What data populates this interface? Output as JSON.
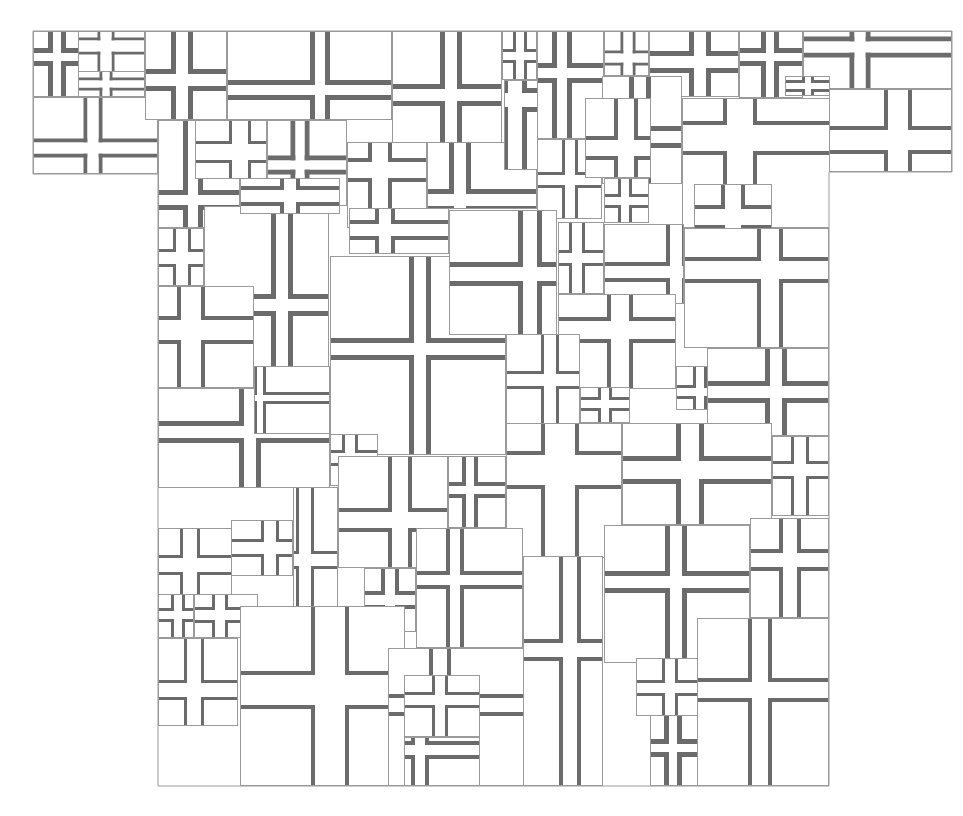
{
  "artwork": {
    "subject": "T-shirt silhouette collage of overlapping cross tiles",
    "canvas": {
      "width": 963,
      "height": 816
    },
    "colors": {
      "background": "#ffffff",
      "tile_fill": "#ffffff",
      "tile_border": "#9a9a9a",
      "cross_band": "#6b6b6b"
    },
    "silhouette": [
      [
        33,
        31
      ],
      [
        952,
        31
      ],
      [
        952,
        172
      ],
      [
        829,
        172
      ],
      [
        829,
        786
      ],
      [
        158,
        786
      ],
      [
        158,
        174
      ],
      [
        33,
        174
      ]
    ],
    "tiles": [
      {
        "x": 33,
        "y": 97,
        "w": 125,
        "h": 77,
        "cx": 93,
        "cy": 148,
        "g": 11,
        "t": 4
      },
      {
        "x": 33,
        "y": 31,
        "w": 46,
        "h": 66,
        "cx": 57,
        "cy": 57,
        "g": 8,
        "t": 5
      },
      {
        "x": 78,
        "y": 31,
        "w": 67,
        "h": 48,
        "cx": 106,
        "cy": 46,
        "g": 11,
        "t": 3
      },
      {
        "x": 78,
        "y": 71,
        "w": 67,
        "h": 26,
        "cx": 106,
        "cy": 84,
        "g": 7,
        "t": 3
      },
      {
        "x": 145,
        "y": 31,
        "w": 82,
        "h": 89,
        "cx": 182,
        "cy": 80,
        "g": 12,
        "t": 5
      },
      {
        "x": 227,
        "y": 31,
        "w": 165,
        "h": 89,
        "cx": 320,
        "cy": 90,
        "g": 10,
        "t": 5
      },
      {
        "x": 392,
        "y": 31,
        "w": 110,
        "h": 112,
        "cx": 451,
        "cy": 95,
        "g": 12,
        "t": 5
      },
      {
        "x": 502,
        "y": 31,
        "w": 35,
        "h": 49,
        "cx": 520,
        "cy": 56,
        "g": 8,
        "t": 3
      },
      {
        "x": 537,
        "y": 31,
        "w": 67,
        "h": 108,
        "cx": 562,
        "cy": 73,
        "g": 10,
        "t": 5
      },
      {
        "x": 604,
        "y": 31,
        "w": 45,
        "h": 45,
        "cx": 628,
        "cy": 58,
        "g": 9,
        "t": 3
      },
      {
        "x": 649,
        "y": 31,
        "w": 90,
        "h": 66,
        "cx": 700,
        "cy": 62,
        "g": 12,
        "t": 5
      },
      {
        "x": 739,
        "y": 31,
        "w": 64,
        "h": 67,
        "cx": 770,
        "cy": 57,
        "g": 8,
        "t": 5
      },
      {
        "x": 803,
        "y": 31,
        "w": 149,
        "h": 58,
        "cx": 860,
        "cy": 47,
        "g": 11,
        "t": 5
      },
      {
        "x": 829,
        "y": 89,
        "w": 123,
        "h": 83,
        "cx": 898,
        "cy": 140,
        "g": 20,
        "t": 4
      },
      {
        "x": 785,
        "y": 76,
        "w": 45,
        "h": 20,
        "cx": 808,
        "cy": 86,
        "g": 6,
        "t": 3
      },
      {
        "x": 158,
        "y": 120,
        "w": 82,
        "h": 108,
        "cx": 193,
        "cy": 200,
        "g": 10,
        "t": 5
      },
      {
        "x": 195,
        "y": 120,
        "w": 72,
        "h": 59,
        "cx": 240,
        "cy": 152,
        "g": 16,
        "t": 3
      },
      {
        "x": 267,
        "y": 120,
        "w": 80,
        "h": 86,
        "cx": 300,
        "cy": 165,
        "g": 9,
        "t": 5
      },
      {
        "x": 347,
        "y": 142,
        "w": 80,
        "h": 86,
        "cx": 380,
        "cy": 170,
        "g": 16,
        "t": 4
      },
      {
        "x": 427,
        "y": 142,
        "w": 110,
        "h": 67,
        "cx": 460,
        "cy": 200,
        "g": 12,
        "t": 5
      },
      {
        "x": 504,
        "y": 80,
        "w": 34,
        "h": 90,
        "cx": 515,
        "cy": 100,
        "g": 14,
        "t": 5
      },
      {
        "x": 537,
        "y": 139,
        "w": 65,
        "h": 80,
        "cx": 570,
        "cy": 180,
        "g": 10,
        "t": 3
      },
      {
        "x": 602,
        "y": 76,
        "w": 80,
        "h": 108,
        "cx": 640,
        "cy": 137,
        "g": 12,
        "t": 5
      },
      {
        "x": 585,
        "y": 98,
        "w": 66,
        "h": 80,
        "cx": 626,
        "cy": 148,
        "g": 16,
        "t": 4
      },
      {
        "x": 604,
        "y": 178,
        "w": 45,
        "h": 45,
        "cx": 625,
        "cy": 201,
        "g": 8,
        "t": 3
      },
      {
        "x": 682,
        "y": 98,
        "w": 148,
        "h": 130,
        "cx": 740,
        "cy": 138,
        "g": 26,
        "t": 4
      },
      {
        "x": 694,
        "y": 184,
        "w": 78,
        "h": 62,
        "cx": 733,
        "cy": 217,
        "g": 16,
        "t": 4
      },
      {
        "x": 158,
        "y": 228,
        "w": 46,
        "h": 58,
        "cx": 182,
        "cy": 258,
        "g": 12,
        "t": 3
      },
      {
        "x": 204,
        "y": 206,
        "w": 125,
        "h": 180,
        "cx": 282,
        "cy": 305,
        "g": 12,
        "t": 5
      },
      {
        "x": 158,
        "y": 286,
        "w": 96,
        "h": 102,
        "cx": 191,
        "cy": 330,
        "g": 20,
        "t": 4
      },
      {
        "x": 240,
        "y": 178,
        "w": 100,
        "h": 36,
        "cx": 290,
        "cy": 196,
        "g": 12,
        "t": 4
      },
      {
        "x": 330,
        "y": 256,
        "w": 176,
        "h": 199,
        "cx": 420,
        "cy": 349,
        "g": 12,
        "t": 5
      },
      {
        "x": 349,
        "y": 208,
        "w": 100,
        "h": 46,
        "cx": 385,
        "cy": 230,
        "g": 12,
        "t": 4
      },
      {
        "x": 449,
        "y": 210,
        "w": 108,
        "h": 125,
        "cx": 530,
        "cy": 274,
        "g": 14,
        "t": 5
      },
      {
        "x": 558,
        "y": 222,
        "w": 46,
        "h": 72,
        "cx": 577,
        "cy": 258,
        "g": 10,
        "t": 3
      },
      {
        "x": 604,
        "y": 224,
        "w": 80,
        "h": 80,
        "cx": 676,
        "cy": 272,
        "g": 12,
        "t": 4
      },
      {
        "x": 684,
        "y": 228,
        "w": 145,
        "h": 120,
        "cx": 770,
        "cy": 270,
        "g": 18,
        "t": 4
      },
      {
        "x": 558,
        "y": 294,
        "w": 118,
        "h": 95,
        "cx": 620,
        "cy": 330,
        "g": 18,
        "t": 4
      },
      {
        "x": 506,
        "y": 334,
        "w": 74,
        "h": 90,
        "cx": 550,
        "cy": 380,
        "g": 12,
        "t": 3
      },
      {
        "x": 580,
        "y": 387,
        "w": 50,
        "h": 36,
        "cx": 605,
        "cy": 404,
        "g": 8,
        "t": 3
      },
      {
        "x": 676,
        "y": 366,
        "w": 55,
        "h": 44,
        "cx": 700,
        "cy": 392,
        "g": 8,
        "t": 3
      },
      {
        "x": 707,
        "y": 348,
        "w": 122,
        "h": 88,
        "cx": 776,
        "cy": 392,
        "g": 12,
        "t": 5
      },
      {
        "x": 158,
        "y": 388,
        "w": 172,
        "h": 100,
        "cx": 250,
        "cy": 432,
        "g": 12,
        "t": 5
      },
      {
        "x": 254,
        "y": 366,
        "w": 76,
        "h": 68,
        "cx": 260,
        "cy": 398,
        "g": 6,
        "t": 3
      },
      {
        "x": 330,
        "y": 434,
        "w": 48,
        "h": 52,
        "cx": 350,
        "cy": 458,
        "g": 10,
        "t": 3
      },
      {
        "x": 338,
        "y": 456,
        "w": 110,
        "h": 112,
        "cx": 400,
        "cy": 520,
        "g": 16,
        "t": 4
      },
      {
        "x": 448,
        "y": 456,
        "w": 58,
        "h": 72,
        "cx": 470,
        "cy": 490,
        "g": 8,
        "t": 4
      },
      {
        "x": 506,
        "y": 423,
        "w": 116,
        "h": 135,
        "cx": 560,
        "cy": 470,
        "g": 30,
        "t": 4
      },
      {
        "x": 622,
        "y": 423,
        "w": 150,
        "h": 102,
        "cx": 690,
        "cy": 470,
        "g": 18,
        "t": 5
      },
      {
        "x": 772,
        "y": 436,
        "w": 57,
        "h": 80,
        "cx": 800,
        "cy": 470,
        "g": 12,
        "t": 3
      },
      {
        "x": 158,
        "y": 528,
        "w": 74,
        "h": 94,
        "cx": 190,
        "cy": 565,
        "g": 14,
        "t": 3
      },
      {
        "x": 231,
        "y": 520,
        "w": 62,
        "h": 56,
        "cx": 270,
        "cy": 548,
        "g": 12,
        "t": 3
      },
      {
        "x": 293,
        "y": 487,
        "w": 45,
        "h": 120,
        "cx": 305,
        "cy": 560,
        "g": 12,
        "t": 3
      },
      {
        "x": 158,
        "y": 594,
        "w": 36,
        "h": 44,
        "cx": 178,
        "cy": 615,
        "g": 8,
        "t": 3
      },
      {
        "x": 194,
        "y": 594,
        "w": 64,
        "h": 44,
        "cx": 220,
        "cy": 615,
        "g": 10,
        "t": 3
      },
      {
        "x": 364,
        "y": 568,
        "w": 52,
        "h": 64,
        "cx": 390,
        "cy": 600,
        "g": 10,
        "t": 4
      },
      {
        "x": 416,
        "y": 528,
        "w": 107,
        "h": 120,
        "cx": 455,
        "cy": 580,
        "g": 10,
        "t": 4
      },
      {
        "x": 158,
        "y": 638,
        "w": 80,
        "h": 88,
        "cx": 194,
        "cy": 690,
        "g": 14,
        "t": 3
      },
      {
        "x": 240,
        "y": 606,
        "w": 165,
        "h": 180,
        "cx": 330,
        "cy": 690,
        "g": 30,
        "t": 4
      },
      {
        "x": 388,
        "y": 648,
        "w": 138,
        "h": 138,
        "cx": 440,
        "cy": 705,
        "g": 14,
        "t": 4
      },
      {
        "x": 404,
        "y": 675,
        "w": 76,
        "h": 62,
        "cx": 440,
        "cy": 700,
        "g": 10,
        "t": 3
      },
      {
        "x": 523,
        "y": 556,
        "w": 80,
        "h": 230,
        "cx": 570,
        "cy": 650,
        "g": 14,
        "t": 4
      },
      {
        "x": 604,
        "y": 525,
        "w": 146,
        "h": 138,
        "cx": 676,
        "cy": 582,
        "g": 12,
        "t": 5
      },
      {
        "x": 750,
        "y": 518,
        "w": 79,
        "h": 100,
        "cx": 790,
        "cy": 560,
        "g": 14,
        "t": 4
      },
      {
        "x": 697,
        "y": 618,
        "w": 132,
        "h": 168,
        "cx": 760,
        "cy": 690,
        "g": 16,
        "t": 4
      },
      {
        "x": 636,
        "y": 658,
        "w": 62,
        "h": 58,
        "cx": 670,
        "cy": 688,
        "g": 10,
        "t": 3
      },
      {
        "x": 650,
        "y": 715,
        "w": 48,
        "h": 71,
        "cx": 673,
        "cy": 748,
        "g": 8,
        "t": 5
      },
      {
        "x": 404,
        "y": 737,
        "w": 76,
        "h": 49,
        "cx": 420,
        "cy": 750,
        "g": 10,
        "t": 4
      }
    ]
  }
}
